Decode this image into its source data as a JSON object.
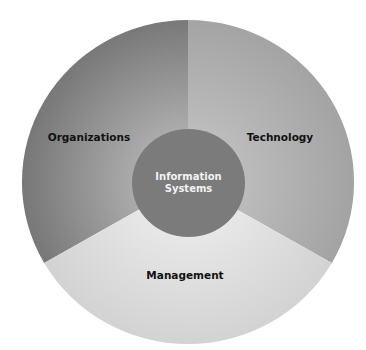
{
  "diagram": {
    "type": "concentric-pie",
    "center": {
      "label_line1": "Information",
      "label_line2": "Systems",
      "color": "#7d7d7d"
    },
    "sectors": [
      {
        "label": "Organizations",
        "color_outer": "#777777",
        "color_inner": "#adadad"
      },
      {
        "label": "Technology",
        "color_outer": "#a3a3a3",
        "color_inner": "#bdbdbd"
      },
      {
        "label": "Management",
        "color_outer": "#d3d3d3",
        "color_inner": "#e6e6e6"
      }
    ]
  }
}
